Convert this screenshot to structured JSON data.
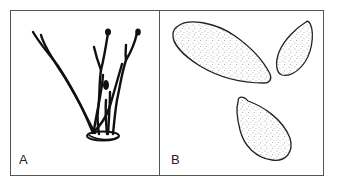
{
  "figure": {
    "panels": [
      {
        "id": "A",
        "label": "A",
        "content": "fungal hyphae / conidiophores arising from a base"
      },
      {
        "id": "B",
        "label": "B",
        "content": "three stippled ovoid spores"
      }
    ],
    "colors": {
      "ink": "#111111",
      "frame": "#555555",
      "background": "#ffffff"
    }
  }
}
